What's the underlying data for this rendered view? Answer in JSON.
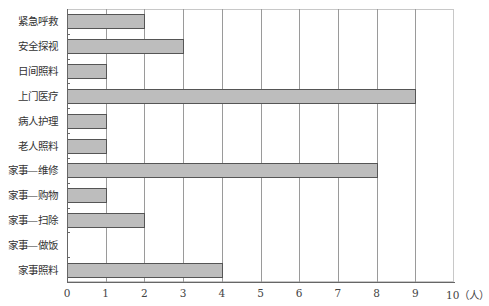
{
  "chart_data": {
    "type": "bar",
    "orientation": "horizontal",
    "title": "",
    "xlabel": "",
    "ylabel": "",
    "x_unit": "（人）",
    "categories": [
      "紧急呼救",
      "安全探视",
      "日间照料",
      "上门医疗",
      "病人护理",
      "老人照料",
      "家事—维修",
      "家事—购物",
      "家事—扫除",
      "家事—做饭",
      "家事照料"
    ],
    "values": [
      2,
      3,
      1,
      9,
      1,
      1,
      8,
      1,
      2,
      0,
      4
    ],
    "xlim": [
      0,
      10
    ],
    "x_ticks": [
      "0",
      "1",
      "2",
      "3",
      "4",
      "5",
      "6",
      "7",
      "8",
      "9",
      "10（人）"
    ],
    "grid": "vertical",
    "legend": null,
    "bar_color": "#bdbdbd",
    "bar_border": "#555555"
  }
}
